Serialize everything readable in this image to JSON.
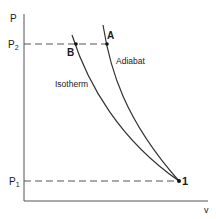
{
  "diagram": {
    "type": "P-v diagram",
    "axes": {
      "y_label": "P",
      "x_label": "v"
    },
    "levels": {
      "p2_label": "P",
      "p2_sub": "2",
      "p1_label": "P",
      "p1_sub": "1"
    },
    "curves": [
      {
        "name": "Isotherm",
        "label": "Isotherm"
      },
      {
        "name": "Adiabat",
        "label": "Adiabat"
      }
    ],
    "points": {
      "A": "A",
      "B": "B",
      "one": "1"
    },
    "colors": {
      "line": "#333333",
      "text": "#1a1a1a",
      "background": "#ffffff"
    }
  }
}
